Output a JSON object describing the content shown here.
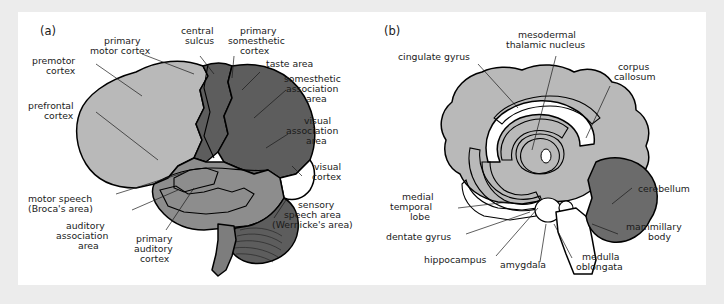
{
  "figure": {
    "background": "#ececec",
    "panel_background": "#ffffff"
  },
  "palette": {
    "light_gray": "#b9b9b9",
    "mid_gray": "#8d8d8d",
    "dark_gray": "#5d5d5d",
    "cerebellum_gray": "#6b6b6b",
    "white": "#ffffff",
    "outline": "#000000",
    "text": "#1a1a1a"
  },
  "panels": [
    {
      "id": "a",
      "tag": "(a)",
      "title": "Lateral view of the cerebral cortex",
      "labels": [
        {
          "id": "premotor-cortex",
          "text": "premotor\ncortex",
          "lines": [
            "premotor",
            "cortex"
          ]
        },
        {
          "id": "prefrontal-cortex",
          "text": "prefrontal\ncortex",
          "lines": [
            "prefrontal",
            "cortex"
          ]
        },
        {
          "id": "primary-motor-cortex",
          "text": "primary\nmotor cortex",
          "lines": [
            "primary",
            "motor cortex"
          ]
        },
        {
          "id": "central-sulcus",
          "text": "central\nsulcus",
          "lines": [
            "central",
            "sulcus"
          ]
        },
        {
          "id": "primary-somesthetic-cortex",
          "text": "primary\nsomesthetic\ncortex",
          "lines": [
            "primary",
            "somesthetic",
            "cortex"
          ]
        },
        {
          "id": "taste-area",
          "text": "taste area",
          "lines": [
            "taste area"
          ]
        },
        {
          "id": "somesthetic-association-area",
          "text": "somesthetic\nassociation\narea",
          "lines": [
            "somesthetic",
            "association",
            "area"
          ]
        },
        {
          "id": "visual-association-area",
          "text": "visual\nassociation\narea",
          "lines": [
            "visual",
            "association",
            "area"
          ]
        },
        {
          "id": "visual-cortex",
          "text": "visual\ncortex",
          "lines": [
            "visual",
            "cortex"
          ]
        },
        {
          "id": "sensory-speech-area",
          "text": "sensory\nspeech area\n(Wernicke's area)",
          "lines": [
            "sensory",
            "speech area",
            "(Wernicke's area)"
          ]
        },
        {
          "id": "motor-speech-area",
          "text": "motor speech\n(Broca's area)",
          "lines": [
            "motor speech",
            "(Broca's area)"
          ]
        },
        {
          "id": "auditory-association-area",
          "text": "auditory\nassociation\narea",
          "lines": [
            "auditory",
            "association",
            "area"
          ]
        },
        {
          "id": "primary-auditory-cortex",
          "text": "primary\nauditory\ncortex",
          "lines": [
            "primary",
            "auditory",
            "cortex"
          ]
        }
      ]
    },
    {
      "id": "b",
      "tag": "(b)",
      "title": "Midsagittal view showing limbic structures",
      "labels": [
        {
          "id": "cingulate-gyrus",
          "text": "cingulate gyrus",
          "lines": [
            "cingulate gyrus"
          ]
        },
        {
          "id": "mesodermal-thalamic-nucleus",
          "text": "mesodermal\nthalamic nucleus",
          "lines": [
            "mesodermal",
            "thalamic nucleus"
          ]
        },
        {
          "id": "corpus-callosum",
          "text": "corpus\ncallosum",
          "lines": [
            "corpus",
            "callosum"
          ]
        },
        {
          "id": "cerebellum",
          "text": "cerebellum",
          "lines": [
            "cerebellum"
          ]
        },
        {
          "id": "mammillary-body",
          "text": "mammillary\nbody",
          "lines": [
            "mammillary",
            "body"
          ]
        },
        {
          "id": "medulla-oblongata",
          "text": "medulla\noblongata",
          "lines": [
            "medulla",
            "oblongata"
          ]
        },
        {
          "id": "amygdala",
          "text": "amygdala",
          "lines": [
            "amygdala"
          ]
        },
        {
          "id": "hippocampus",
          "text": "hippocampus",
          "lines": [
            "hippocampus"
          ]
        },
        {
          "id": "dentate-gyrus",
          "text": "dentate gyrus",
          "lines": [
            "dentate gyrus"
          ]
        },
        {
          "id": "medial-temporal-lobe",
          "text": "medial\ntemporal\nlobe",
          "lines": [
            "medial",
            "temporal",
            "lobe"
          ]
        }
      ]
    }
  ]
}
